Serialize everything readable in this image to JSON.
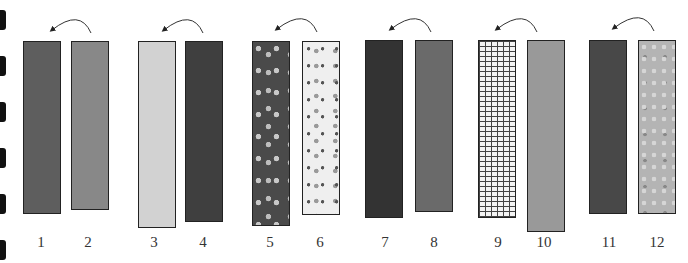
{
  "diagram": {
    "left_margin_marks": 6,
    "pairs": [
      {
        "strips": [
          {
            "label": "1",
            "fill": "#5e5e5e",
            "pattern": "solid"
          },
          {
            "label": "2",
            "fill": "#888888",
            "pattern": "solid"
          }
        ]
      },
      {
        "strips": [
          {
            "label": "3",
            "fill": "#d2d2d2",
            "pattern": "solid"
          },
          {
            "label": "4",
            "fill": "#3f3f3f",
            "pattern": "solid"
          }
        ]
      },
      {
        "strips": [
          {
            "label": "5",
            "fill": "#4a4a4a",
            "pattern": "flower-dark"
          },
          {
            "label": "6",
            "fill": "#efefef",
            "pattern": "flower-light"
          }
        ]
      },
      {
        "strips": [
          {
            "label": "7",
            "fill": "#333333",
            "pattern": "solid"
          },
          {
            "label": "8",
            "fill": "#6a6a6a",
            "pattern": "solid"
          }
        ]
      },
      {
        "strips": [
          {
            "label": "9",
            "fill": "#f4f4f4",
            "pattern": "plaid"
          },
          {
            "label": "10",
            "fill": "#999999",
            "pattern": "solid"
          }
        ]
      },
      {
        "strips": [
          {
            "label": "11",
            "fill": "#484848",
            "pattern": "solid"
          },
          {
            "label": "12",
            "fill": "#b4b4b4",
            "pattern": "floral-gray"
          }
        ]
      }
    ]
  }
}
